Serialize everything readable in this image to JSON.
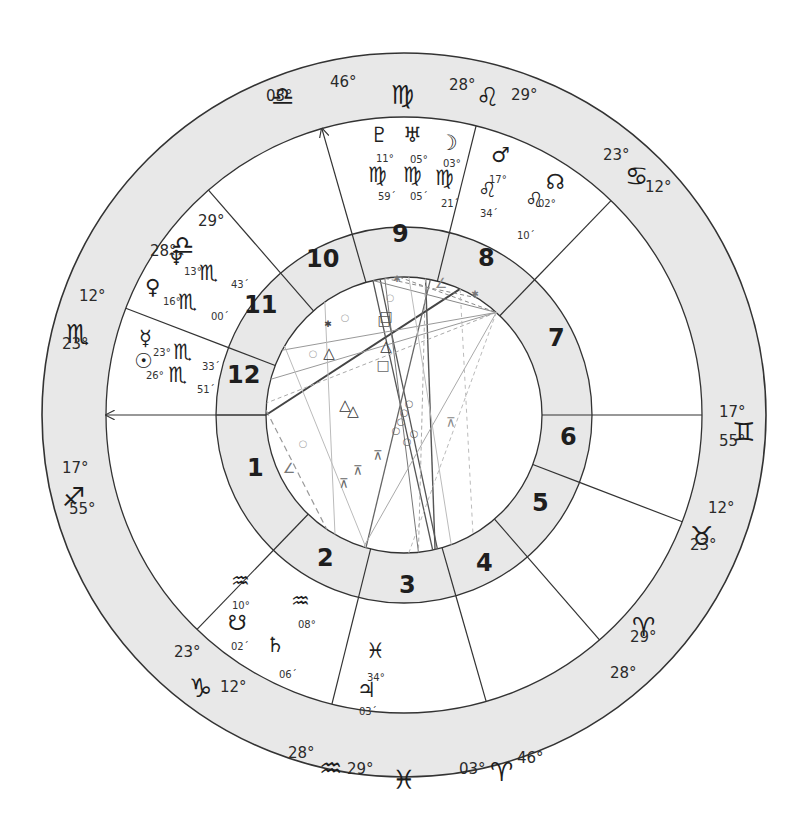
{
  "chart": {
    "type": "natal-wheel",
    "colors": {
      "ring": "#e8e8e8",
      "line": "#333333",
      "aspect_dark": "#555555",
      "aspect_light": "#aaaaaa"
    }
  },
  "zodiac_ring": [
    {
      "sign": "Virgo",
      "glyph": "♍",
      "deg_a": "",
      "deg_b": ""
    },
    {
      "sign": "Libra",
      "glyph": "♎",
      "deg_a": "03°",
      "deg_b": "46°"
    },
    {
      "sign": "Leo",
      "glyph": "♌",
      "deg_a": "28°",
      "deg_b": "29°"
    },
    {
      "sign": "Cancer",
      "glyph": "♋",
      "deg_a": "23°",
      "deg_b": "12°"
    },
    {
      "sign": "Gemini",
      "glyph": "♊",
      "deg_a": "17°",
      "deg_b": "55°"
    },
    {
      "sign": "Taurus",
      "glyph": "♉",
      "deg_a": "12°",
      "deg_b": "23°"
    },
    {
      "sign": "Aries",
      "glyph": "♈",
      "deg_a": "28°",
      "deg_b": "29°"
    },
    {
      "sign": "Aries",
      "glyph": "♈",
      "deg_a": "03°",
      "deg_b": "46°"
    },
    {
      "sign": "Pisces",
      "glyph": "♓",
      "deg_a": "",
      "deg_b": ""
    },
    {
      "sign": "Aquarius",
      "glyph": "♒",
      "deg_a": "28°",
      "deg_b": "29°"
    },
    {
      "sign": "Capricorn",
      "glyph": "♑",
      "deg_a": "23°",
      "deg_b": "12°"
    },
    {
      "sign": "Sagittarius",
      "glyph": "♐",
      "deg_a": "17°",
      "deg_b": "55°"
    },
    {
      "sign": "Scorpio",
      "glyph": "♏",
      "deg_a": "12°",
      "deg_b": "23°"
    },
    {
      "sign": "Libra",
      "glyph": "♎",
      "deg_a": "29°",
      "deg_b": "28°"
    }
  ],
  "houses": [
    "1",
    "2",
    "3",
    "4",
    "5",
    "6",
    "7",
    "8",
    "9",
    "10",
    "11",
    "12"
  ],
  "planets": [
    {
      "name": "Pluto",
      "glyph": "♇",
      "deg": "11°",
      "sign_glyph": "♍",
      "min": "59´"
    },
    {
      "name": "Uranus",
      "glyph": "♅",
      "deg": "05°",
      "sign_glyph": "♍",
      "min": "05´"
    },
    {
      "name": "Moon",
      "glyph": "☽",
      "deg": "03°",
      "sign_glyph": "♍",
      "min": "21´"
    },
    {
      "name": "Mars",
      "glyph": "♂",
      "deg": "17°",
      "sign_glyph": "♌",
      "min": "34´"
    },
    {
      "name": "North Node",
      "glyph": "☊",
      "deg": "02°",
      "sign_glyph": "♌",
      "min": "10´"
    },
    {
      "name": "Neptune",
      "glyph": "♆",
      "deg": "13°",
      "sign_glyph": "♏",
      "min": "43´"
    },
    {
      "name": "Venus",
      "glyph": "♀",
      "deg": "16°",
      "sign_glyph": "♏",
      "min": "00´"
    },
    {
      "name": "Mercury",
      "glyph": "☿",
      "deg": "23°",
      "sign_glyph": "♏",
      "min": "33´"
    },
    {
      "name": "Sun",
      "glyph": "☉",
      "deg": "26°",
      "sign_glyph": "♏",
      "min": "51´"
    },
    {
      "name": "Chiron",
      "glyph": "♒",
      "deg": "10°",
      "sign_glyph": "",
      "min": ""
    },
    {
      "name": "Aquarius2",
      "glyph": "♒",
      "deg": "08°",
      "sign_glyph": "",
      "min": ""
    },
    {
      "name": "South Node",
      "glyph": "☋",
      "deg": "",
      "sign_glyph": "",
      "min": "02´"
    },
    {
      "name": "Saturn",
      "glyph": "♄",
      "deg": "",
      "sign_glyph": "",
      "min": "06´"
    },
    {
      "name": "Pisces",
      "glyph": "♓",
      "deg": "34°",
      "sign_glyph": "",
      "min": ""
    },
    {
      "name": "Jupiter",
      "glyph": "♃",
      "deg": "",
      "sign_glyph": "",
      "min": "03´"
    }
  ]
}
